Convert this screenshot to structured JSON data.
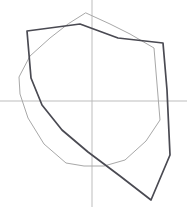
{
  "canvas": {
    "width": 187,
    "height": 210,
    "background_color": "#ffffff",
    "title": "Shield outline sketch with construction axes"
  },
  "axes": {
    "horizontal": {
      "label": "horizontal construction axis",
      "color": "#b5b5b5",
      "stroke_width": 0.9,
      "x1": 0,
      "y1": 101,
      "x2": 187,
      "y2": 101
    },
    "vertical": {
      "label": "vertical construction axis",
      "color": "#b5b5b5",
      "stroke_width": 0.9,
      "x1": 92,
      "y1": 0,
      "x2": 92,
      "y2": 207
    },
    "origin": {
      "x": 92,
      "y": 101
    }
  },
  "shapes": [
    {
      "name": "light-shield-outline",
      "role": "underlying light guide outline",
      "color": "#a8a8a8",
      "stroke_width": 1.0,
      "closed": true,
      "points": [
        [
          86,
          13
        ],
        [
          110,
          24
        ],
        [
          130,
          34
        ],
        [
          154,
          48
        ],
        [
          160,
          120
        ],
        [
          146,
          141
        ],
        [
          125,
          160
        ],
        [
          104,
          166
        ],
        [
          84,
          166
        ],
        [
          66,
          163
        ],
        [
          44,
          144
        ],
        [
          28,
          118
        ],
        [
          20,
          94
        ],
        [
          19,
          77
        ],
        [
          30,
          56
        ],
        [
          50,
          38
        ],
        [
          68,
          24
        ]
      ]
    },
    {
      "name": "dark-shield-outline",
      "role": "primary dark shield outline",
      "color": "#4a4a52",
      "stroke_width": 1.7,
      "closed": true,
      "points": [
        [
          80,
          24
        ],
        [
          118,
          38
        ],
        [
          163,
          43
        ],
        [
          167,
          90
        ],
        [
          170,
          155
        ],
        [
          151,
          200
        ],
        [
          120,
          176
        ],
        [
          88,
          152
        ],
        [
          62,
          130
        ],
        [
          42,
          105
        ],
        [
          31,
          78
        ],
        [
          27,
          31
        ]
      ]
    }
  ]
}
